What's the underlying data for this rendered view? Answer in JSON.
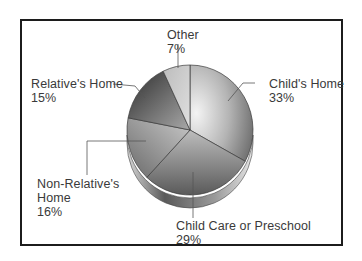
{
  "chart_data": {
    "type": "pie",
    "title": "",
    "style": "3d-grayscale",
    "categories": [
      "Child's Home",
      "Child Care or Preschool",
      "Non-Relative's Home",
      "Relative's Home",
      "Other"
    ],
    "values": [
      33,
      29,
      16,
      15,
      7
    ],
    "unit": "%",
    "labels": [
      {
        "name": "Child's Home",
        "pct": "33%"
      },
      {
        "name": "Child Care or Preschool",
        "pct": "29%"
      },
      {
        "name": "Non-Relative's Home",
        "name_line1": "Non-Relative's",
        "name_line2": "Home",
        "pct": "16%"
      },
      {
        "name": "Relative's Home",
        "pct": "15%"
      },
      {
        "name": "Other",
        "pct": "7%"
      }
    ],
    "legend": "none (direct labels with leader lines)"
  },
  "colors": {
    "border": "#1c1c1c",
    "text": "#3a3a3a",
    "leader": "#555555"
  }
}
